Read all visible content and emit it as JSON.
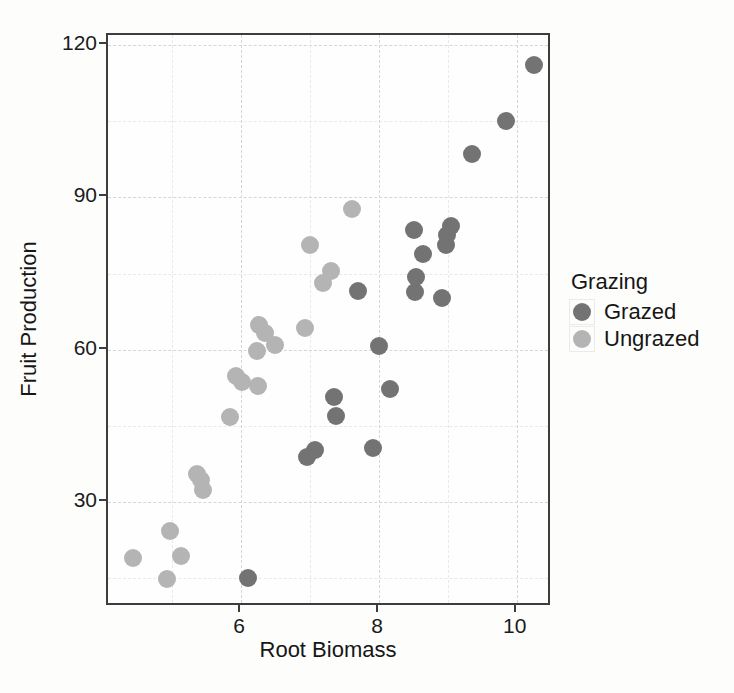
{
  "chart_data": {
    "type": "scatter",
    "xlabel": "Root Biomass",
    "ylabel": "Fruit Production",
    "xlim": [
      4.07,
      10.51
    ],
    "ylim": [
      9.3,
      122.0
    ],
    "x_major_ticks": [
      6,
      8,
      10
    ],
    "x_minor_ticks": [
      5,
      7,
      9
    ],
    "y_major_ticks": [
      30,
      60,
      90,
      120
    ],
    "y_minor_ticks": [
      15,
      45,
      75,
      105
    ],
    "grid": true,
    "legend_position": "right",
    "legend": {
      "title": "Grazing",
      "entries": [
        "Grazed",
        "Ungrazed"
      ]
    },
    "colors": {
      "grazed": "#737373",
      "ungrazed": "#b4b4b4"
    },
    "series": [
      {
        "name": "Grazed",
        "color": "#737373",
        "points": [
          [
            6.106,
            14.95
          ],
          [
            6.958,
            38.94
          ],
          [
            7.066,
            40.2
          ],
          [
            7.354,
            50.7
          ],
          [
            7.382,
            46.9
          ],
          [
            7.691,
            71.64
          ],
          [
            7.916,
            40.62
          ],
          [
            8.001,
            60.77
          ],
          [
            8.158,
            52.3
          ],
          [
            8.508,
            83.5
          ],
          [
            8.515,
            71.3
          ],
          [
            8.53,
            74.4
          ],
          [
            8.643,
            78.8
          ],
          [
            8.91,
            70.11
          ],
          [
            8.975,
            80.6
          ],
          [
            8.988,
            82.7
          ],
          [
            9.039,
            84.37
          ],
          [
            9.351,
            98.47
          ],
          [
            9.844,
            105.07
          ],
          [
            10.253,
            116.05
          ]
        ]
      },
      {
        "name": "Ungrazed",
        "color": "#b4b4b4",
        "points": [
          [
            4.426,
            18.89
          ],
          [
            4.919,
            14.73
          ],
          [
            4.975,
            24.25
          ],
          [
            5.13,
            19.28
          ],
          [
            5.359,
            35.53
          ],
          [
            5.417,
            34.25
          ],
          [
            5.451,
            32.35
          ],
          [
            5.836,
            46.73
          ],
          [
            5.928,
            54.86
          ],
          [
            6.013,
            53.61
          ],
          [
            6.225,
            59.77
          ],
          [
            6.248,
            52.92
          ],
          [
            6.264,
            64.81
          ],
          [
            6.352,
            63.21
          ],
          [
            6.487,
            60.98
          ],
          [
            6.93,
            64.34
          ],
          [
            7.001,
            80.64
          ],
          [
            7.181,
            73.24
          ],
          [
            7.302,
            75.49
          ],
          [
            7.614,
            87.73
          ]
        ]
      }
    ]
  }
}
